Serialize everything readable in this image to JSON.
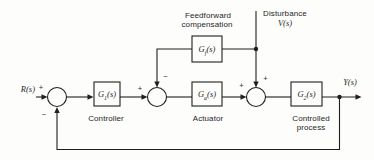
{
  "figure": {
    "paper": "#fdfdfb",
    "ink": "#1f1f1f"
  },
  "signals": {
    "input_label": "R(s)",
    "output_label": "Y(s)",
    "disturbance_caption": "Disturbance",
    "disturbance_label": "V(s)"
  },
  "blocks": {
    "feedforward": {
      "sym": "G",
      "sub": "f",
      "arg": "(s)",
      "caption_line1": "Feedforward",
      "caption_line2": "compensation"
    },
    "controller": {
      "sym": "G",
      "sub": "1",
      "arg": "(s)",
      "caption": "Controller"
    },
    "actuator": {
      "sym": "G",
      "sub": "a",
      "arg": "(s)",
      "caption": "Actuator"
    },
    "process": {
      "sym": "G",
      "sub": "2",
      "arg": "(s)",
      "caption_line1": "Controlled",
      "caption_line2": "process"
    }
  },
  "signs": {
    "sum1_reference": "+",
    "sum1_feedback": "−",
    "sum2_input": "+",
    "sum2_feedforward": "−",
    "sum3_input": "+",
    "sum3_disturbance": "+"
  }
}
